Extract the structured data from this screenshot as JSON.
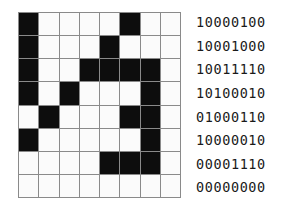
{
  "figure": {
    "type": "bitmap-grid-with-binary-labels",
    "rows": 8,
    "columns": 8,
    "colors": {
      "on_cell": "#0d0d0d",
      "off_cell": "#fbfbfb",
      "gridline": "#8a8a8a",
      "text": "#1a1a1a",
      "background": "#ffffff"
    }
  },
  "grid": {
    "rows": [
      [
        1,
        0,
        0,
        0,
        0,
        1,
        0,
        0
      ],
      [
        1,
        0,
        0,
        0,
        1,
        0,
        0,
        0
      ],
      [
        1,
        0,
        0,
        1,
        1,
        1,
        1,
        0
      ],
      [
        1,
        0,
        1,
        0,
        0,
        0,
        1,
        0
      ],
      [
        0,
        1,
        0,
        0,
        0,
        1,
        1,
        0
      ],
      [
        1,
        0,
        0,
        0,
        0,
        0,
        1,
        0
      ],
      [
        0,
        0,
        0,
        0,
        1,
        1,
        1,
        0
      ],
      [
        0,
        0,
        0,
        0,
        0,
        0,
        0,
        0
      ]
    ]
  },
  "binary_labels": {
    "rows": [
      "10000100",
      "10001000",
      "10011110",
      "10100010",
      "01000110",
      "10000010",
      "00001110",
      "00000000"
    ]
  }
}
